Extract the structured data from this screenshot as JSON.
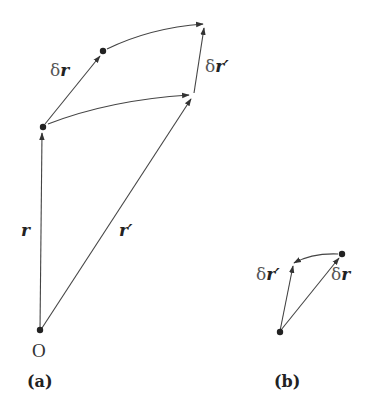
{
  "figure": {
    "panel_a": {
      "caption": "(a)",
      "origin_label": "O",
      "labels": {
        "r": "r",
        "r_prime": "r′",
        "delta_r": "r",
        "delta_r_prime": "r′",
        "delta_symbol": "δ"
      }
    },
    "panel_b": {
      "caption": "(b)",
      "labels": {
        "delta_r_prime": "r′",
        "delta_r": "r",
        "delta_symbol": "δ"
      }
    },
    "colors": {
      "stroke": "#333333",
      "dot": "#222222",
      "background": "#ffffff"
    }
  }
}
